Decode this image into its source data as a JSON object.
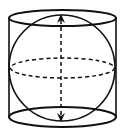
{
  "diagram": {
    "colors": {
      "stroke": "#111111",
      "background": "#ffffff"
    },
    "cylinder": {
      "left_x": 9,
      "right_x": 116,
      "top_ellipse": {
        "cx": 62.5,
        "cy": 18,
        "rx": 53.5,
        "ry": 8
      },
      "bottom_ellipse": {
        "cx": 62.5,
        "cy": 117,
        "rx": 53.5,
        "ry": 10
      }
    },
    "sphere": {
      "cx": 62,
      "cy": 68,
      "r": 53
    },
    "equator": {
      "cx": 62.5,
      "cy": 68,
      "rx": 52,
      "ry": 10,
      "dashed": true
    },
    "axis": {
      "x": 61,
      "y_top": 14,
      "y_bottom": 122,
      "dashed": true,
      "arrows": "both"
    }
  }
}
